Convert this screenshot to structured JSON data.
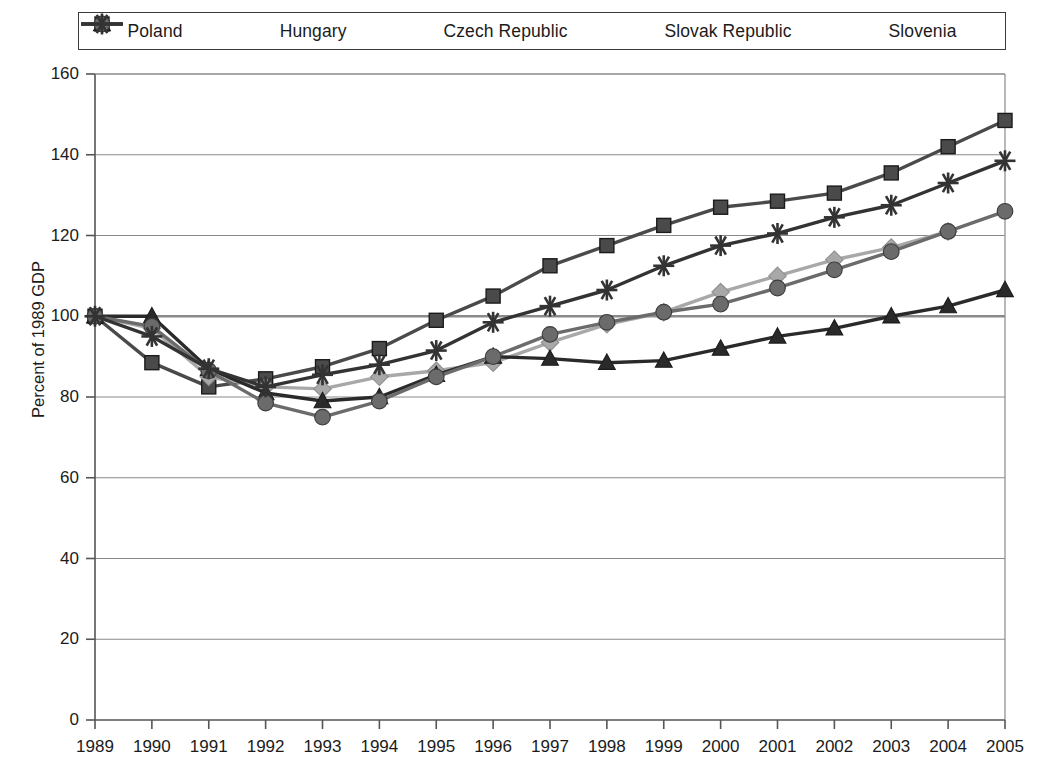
{
  "chart_data": {
    "type": "line",
    "title": "",
    "xlabel": "",
    "ylabel": "Percent of 1989 GDP",
    "x": [
      1989,
      1990,
      1991,
      1992,
      1993,
      1994,
      1995,
      1996,
      1997,
      1998,
      1999,
      2000,
      2001,
      2002,
      2003,
      2004,
      2005
    ],
    "xlim": [
      1989,
      2005
    ],
    "ylim": [
      0,
      160
    ],
    "yticks": [
      0,
      20,
      40,
      60,
      80,
      100,
      120,
      140,
      160
    ],
    "xticks": [
      "1989",
      "1990",
      "1991",
      "1992",
      "1993",
      "1994",
      "1995",
      "1996",
      "1997",
      "1998",
      "1999",
      "2000",
      "2001",
      "2002",
      "2003",
      "2004",
      "2005"
    ],
    "grid": true,
    "legend_position": "top",
    "reference_line": 100,
    "series": [
      {
        "name": "Poland",
        "marker": "square",
        "color": "#4a4a4a",
        "values": [
          100,
          88.5,
          82.5,
          84.5,
          87.5,
          92,
          99,
          105,
          112.5,
          117.5,
          122.5,
          127,
          128.5,
          130.5,
          135.5,
          142,
          148.5
        ]
      },
      {
        "name": "Hungary",
        "marker": "diamond",
        "color": "#a8a8a8",
        "values": [
          100,
          97,
          85,
          82.5,
          82,
          85,
          86.5,
          88.5,
          93.5,
          98,
          101,
          106,
          110,
          114,
          117,
          121,
          null
        ]
      },
      {
        "name": "Czech Republic",
        "marker": "triangle",
        "color": "#2a2a2a",
        "values": [
          100,
          100,
          87,
          81,
          79,
          80,
          85.5,
          90,
          89.5,
          88.5,
          89,
          92,
          95,
          97,
          100,
          102.5,
          106.5
        ]
      },
      {
        "name": "Slovak Republic",
        "marker": "circle",
        "color": "#6b6b6b",
        "values": [
          100,
          97.5,
          86.5,
          78.5,
          75,
          79,
          85,
          90,
          95.5,
          98.5,
          101,
          103,
          107,
          111.5,
          116,
          121,
          126
        ]
      },
      {
        "name": "Slovenia",
        "marker": "asterisk",
        "color": "#333333",
        "values": [
          100,
          95,
          87,
          82.5,
          85.5,
          88,
          91.5,
          98.5,
          102.5,
          106.5,
          112.5,
          117.5,
          120.5,
          124.5,
          127.5,
          133,
          138.5
        ]
      }
    ]
  },
  "legend": {
    "items": [
      {
        "label": "Poland"
      },
      {
        "label": "Hungary"
      },
      {
        "label": "Czech Republic"
      },
      {
        "label": "Slovak Republic"
      },
      {
        "label": "Slovenia"
      }
    ]
  },
  "axes": {
    "y_title": "Percent of 1989 GDP"
  }
}
